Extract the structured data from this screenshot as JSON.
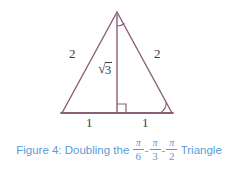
{
  "figure": {
    "domain_kind": "geometry-diagram",
    "colors": {
      "stroke": "#8b5f77",
      "label_text": "#3d3a4a",
      "caption_text": "#5b9bd5",
      "background": "#ffffff"
    },
    "diagram": {
      "shape_name": "isosceles-triangle-with-altitude",
      "vertices": {
        "apex": [
          117,
          12
        ],
        "left": [
          62,
          113
        ],
        "right": [
          172,
          113
        ],
        "foot": [
          117,
          113
        ]
      },
      "labels": {
        "left_side": "2",
        "right_side": "2",
        "altitude": "3",
        "altitude_radical": "√",
        "base_left": "1",
        "base_right": "1"
      },
      "angle_marks": [
        {
          "name": "apex-angle-arc",
          "at": "apex"
        },
        {
          "name": "right-angle-square",
          "at": "foot"
        },
        {
          "name": "right-vertex-angle-arc",
          "at": "right"
        }
      ]
    },
    "caption": {
      "prefix": "Figure 4:  Doubling the",
      "fractions": [
        {
          "numerator": "π",
          "denominator": "6"
        },
        {
          "numerator": "π",
          "denominator": "3"
        },
        {
          "numerator": "π",
          "denominator": "2"
        }
      ],
      "separator": "-",
      "suffix": "Triangle"
    }
  }
}
